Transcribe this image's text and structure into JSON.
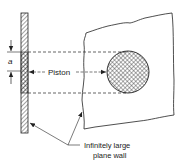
{
  "figure": {
    "colors": {
      "background": "#ffffff",
      "ink": "#222222"
    },
    "labels": {
      "dimension": "a",
      "piston": "Piston",
      "wall_line1": "Infinitely large",
      "wall_line2": "plane wall"
    }
  }
}
